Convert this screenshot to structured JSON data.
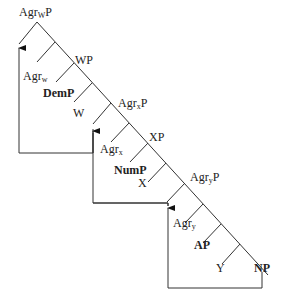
{
  "diagram": {
    "type": "syntax-tree",
    "nodes": {
      "root": {
        "base": "Agr",
        "sub": "W",
        "tail": "P"
      },
      "wp": {
        "text": "WP"
      },
      "agrw": {
        "base": "Agr",
        "sub": "w"
      },
      "demp": {
        "text": "DemP"
      },
      "w": {
        "text": "W"
      },
      "agrxp": {
        "base": "Agr",
        "sub": "x",
        "tail": "P"
      },
      "xp": {
        "text": "XP"
      },
      "agrx": {
        "base": "Agr",
        "sub": "x"
      },
      "nump": {
        "text": "NumP"
      },
      "x": {
        "text": "X"
      },
      "agryp": {
        "base": "Agr",
        "sub": "y",
        "tail": "P"
      },
      "agry": {
        "base": "Agr",
        "sub": "y"
      },
      "ap": {
        "text": "AP"
      },
      "y": {
        "text": "Y"
      },
      "np": {
        "text": "NP"
      }
    },
    "movements": [
      {
        "from": "DemP",
        "to": "Spec-AgrwP"
      },
      {
        "from": "NumP",
        "to": "Spec-AgrxP"
      },
      {
        "from": "NP",
        "to": "Spec-AgryP"
      }
    ],
    "colors": {
      "line": "#333333",
      "text": "#222222",
      "background": "#ffffff"
    }
  }
}
